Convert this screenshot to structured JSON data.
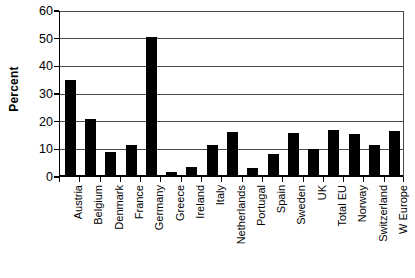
{
  "chart_data": {
    "type": "bar",
    "title": "",
    "xlabel": "",
    "ylabel": "Percent",
    "ylim": [
      0,
      60
    ],
    "yticks": [
      0,
      10,
      20,
      30,
      40,
      50,
      60
    ],
    "grid": true,
    "legend": "none",
    "bar_color": "#000000",
    "gridline_color": "#4a4a4a",
    "axis_color": "#000000",
    "categories": [
      "Austria",
      "Belgium",
      "Denmark",
      "France",
      "Germany",
      "Greece",
      "Ireland",
      "Italy",
      "Netherlands",
      "Portugal",
      "Spain",
      "Sweden",
      "UK",
      "Total EU",
      "Norway",
      "Switzerland",
      "W Europe"
    ],
    "values": [
      35.0,
      20.8,
      8.9,
      11.7,
      50.7,
      1.7,
      3.5,
      11.4,
      16.2,
      3.4,
      8.3,
      16.0,
      10.0,
      16.9,
      15.7,
      11.7,
      16.5
    ]
  }
}
